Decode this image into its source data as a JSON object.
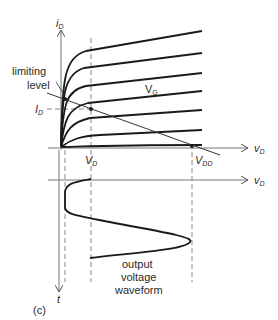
{
  "diagram": {
    "panel_label": "(c)",
    "axes": {
      "y_axis_label": "i",
      "y_axis_sub": "D",
      "x_axis_label": "v",
      "x_axis_sub": "D",
      "lower_x_axis_label": "v",
      "lower_x_axis_sub": "D",
      "time_axis_label": "t"
    },
    "annotations": {
      "limiting_level_line1": "limiting",
      "limiting_level_line2": "level",
      "id_quiescent": "I",
      "id_quiescent_sub": "D",
      "vg_label": "V",
      "vg_sub": "G",
      "vd_quiescent": "V",
      "vd_quiescent_sub": "D",
      "vdd": "V",
      "vdd_sub": "DD",
      "waveform_line1": "output",
      "waveform_line2": "voltage",
      "waveform_line3": "waveform"
    },
    "colors": {
      "curve": "#1a1a1a",
      "axis": "#555555",
      "dashed": "#777777"
    }
  }
}
